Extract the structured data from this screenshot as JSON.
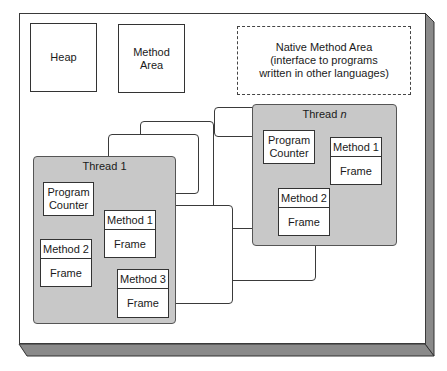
{
  "diagram": {
    "heap": {
      "label": "Heap"
    },
    "method_area": {
      "label_line1": "Method",
      "label_line2": "Area"
    },
    "native_method_area": {
      "line1": "Native Method Area",
      "line2": "(interface to programs",
      "line3": "written in other languages)"
    },
    "thread_1": {
      "title": "Thread 1",
      "program_counter": {
        "line1": "Program",
        "line2": "Counter"
      },
      "stack_frames": [
        {
          "method": "Method 1",
          "frame": "Frame"
        },
        {
          "method": "Method 2",
          "frame": "Frame"
        },
        {
          "method": "Method 3",
          "frame": "Frame"
        }
      ]
    },
    "thread_n": {
      "title_prefix": "Thread ",
      "title_var": "n",
      "program_counter": {
        "line1": "Program",
        "line2": "Counter"
      },
      "stack_frames": [
        {
          "method": "Method 1",
          "frame": "Frame"
        },
        {
          "method": "Method 2",
          "frame": "Frame"
        }
      ]
    },
    "colors": {
      "thread_fill": "#c8c8c8",
      "outline": "#333333",
      "shadow_edge": "#8a8a8a",
      "background": "#ffffff"
    }
  }
}
